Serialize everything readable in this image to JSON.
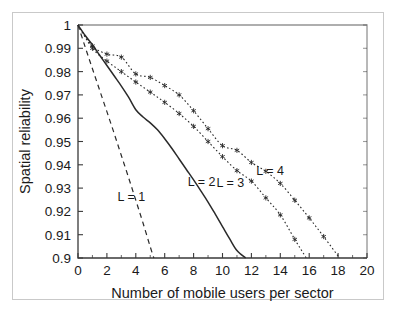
{
  "figure": {
    "background_color": "#ffffff",
    "frame_color": "#c9c9c9",
    "ink_color": "#2a2a2a"
  },
  "chart_data": {
    "type": "line",
    "title": "",
    "subtitle": "",
    "xlabel": "Number of mobile users per sector",
    "ylabel": "Spatial reliability",
    "xlim": [
      0,
      20
    ],
    "ylim": [
      0.9,
      1.0
    ],
    "xticks": [
      0,
      2,
      4,
      6,
      8,
      10,
      12,
      14,
      16,
      18,
      20
    ],
    "xticklabels": [
      "0",
      "2",
      "4",
      "6",
      "8",
      "10",
      "12",
      "14",
      "16",
      "18",
      "20"
    ],
    "yticks": [
      0.9,
      0.91,
      0.92,
      0.93,
      0.94,
      0.95,
      0.96,
      0.97,
      0.98,
      0.99,
      1.0
    ],
    "yticklabels": [
      "0.9",
      "0.91",
      "0.92",
      "0.93",
      "0.94",
      "0.95",
      "0.96",
      "0.97",
      "0.98",
      "0.99",
      "1"
    ],
    "grid": false,
    "legend": "inline-annotations",
    "legend_position": "inline",
    "minor_xticks": [
      1,
      3,
      5,
      7,
      9,
      11,
      13,
      15,
      17,
      19
    ],
    "series": [
      {
        "name": "L = 1",
        "label": "L = 1",
        "linestyle": "dashed",
        "marker": "none",
        "color": "#2a2a2a",
        "annotation_x": 3.7,
        "annotation_y": 0.9245,
        "x": [
          0.0,
          0.5,
          1.0,
          1.5,
          2.0,
          2.5,
          3.0,
          3.5,
          4.0,
          4.5,
          5.0,
          5.25
        ],
        "y": [
          1.0,
          0.9905,
          0.9812,
          0.972,
          0.9628,
          0.9535,
          0.944,
          0.9345,
          0.9248,
          0.915,
          0.9048,
          0.9
        ]
      },
      {
        "name": "L = 2",
        "label": "L = 2",
        "linestyle": "solid",
        "marker": "none",
        "color": "#2a2a2a",
        "annotation_x": 8.55,
        "annotation_y": 0.9308,
        "x": [
          0.0,
          0.5,
          1.0,
          1.5,
          2.0,
          2.5,
          3.0,
          3.5,
          4.0,
          4.5,
          5.0,
          5.5,
          6.0,
          6.5,
          7.0,
          7.5,
          8.0,
          8.5,
          9.0,
          9.5,
          10.0,
          10.5,
          11.0,
          11.6
        ],
        "y": [
          1.0,
          0.9955,
          0.9915,
          0.987,
          0.9826,
          0.9782,
          0.9738,
          0.969,
          0.9636,
          0.9605,
          0.958,
          0.955,
          0.9512,
          0.947,
          0.9425,
          0.938,
          0.9335,
          0.9288,
          0.924,
          0.9188,
          0.9135,
          0.9082,
          0.9032,
          0.9
        ]
      },
      {
        "name": "L = 3",
        "label": "L = 3",
        "linestyle": "dotted",
        "marker": "star",
        "color": "#2a2a2a",
        "annotation_x": 10.55,
        "annotation_y": 0.9305,
        "x": [
          0,
          1,
          2,
          3,
          4,
          5,
          6,
          7,
          8,
          9,
          10,
          11,
          12,
          13,
          14,
          15,
          15.8
        ],
        "y": [
          1.0,
          0.99,
          0.9845,
          0.98,
          0.9755,
          0.9712,
          0.9668,
          0.962,
          0.9565,
          0.95,
          0.9435,
          0.9375,
          0.933,
          0.9258,
          0.9185,
          0.908,
          0.9
        ]
      },
      {
        "name": "L = 4",
        "label": "L = 4",
        "linestyle": "dotted",
        "marker": "star",
        "color": "#2a2a2a",
        "annotation_x": 13.3,
        "annotation_y": 0.9355,
        "x": [
          0,
          1,
          2,
          3,
          4,
          5,
          6,
          7,
          8,
          9,
          10,
          11,
          12,
          13,
          14,
          15,
          16,
          17,
          18.1
        ],
        "y": [
          1.0,
          0.991,
          0.9875,
          0.9862,
          0.979,
          0.9775,
          0.974,
          0.97,
          0.9632,
          0.9555,
          0.9482,
          0.9462,
          0.941,
          0.9372,
          0.932,
          0.9248,
          0.9172,
          0.9092,
          0.9
        ]
      }
    ]
  }
}
